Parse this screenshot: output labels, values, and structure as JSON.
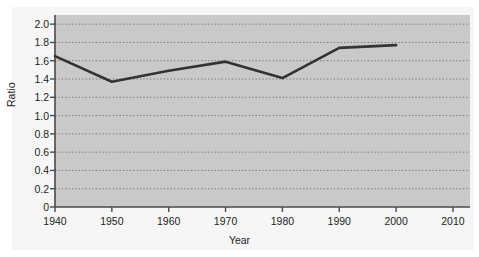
{
  "figure": {
    "background_color": "#f6f6f6",
    "plot_background_color": "#c9c9c9",
    "line_color": "#333333",
    "axis_color": "#4a4a4a",
    "grid_color": "#6e6e6e"
  },
  "chart_data": {
    "type": "line",
    "title": "",
    "xlabel": "Year",
    "ylabel": "Ratio",
    "x": [
      1940,
      1950,
      1960,
      1970,
      1980,
      1990,
      2000
    ],
    "values": [
      1.65,
      1.37,
      1.49,
      1.59,
      1.41,
      1.74,
      1.77
    ],
    "series": [
      {
        "name": "Ratio",
        "x": [
          1940,
          1950,
          1960,
          1970,
          1980,
          1990,
          2000
        ],
        "values": [
          1.65,
          1.37,
          1.49,
          1.59,
          1.41,
          1.74,
          1.77
        ]
      }
    ],
    "xlim": [
      1940,
      2013
    ],
    "ylim": [
      0,
      2.1
    ],
    "xticks": [
      1940,
      1950,
      1960,
      1970,
      1980,
      1990,
      2010
    ],
    "xtick_labels": [
      "1940",
      "1950",
      "1960",
      "1970",
      "1980",
      "1990",
      "2000",
      "2010"
    ],
    "xticks_all": [
      1940,
      1950,
      1960,
      1970,
      1980,
      1990,
      2000,
      2010
    ],
    "yticks": [
      0,
      0.2,
      0.4,
      0.6,
      0.8,
      1.0,
      1.2,
      1.4,
      1.6,
      1.8,
      2.0
    ],
    "ytick_labels": [
      "0",
      "0.2",
      "0.4",
      "0.6",
      "0.8",
      "1.0",
      "1.2",
      "1.4",
      "1.6",
      "1.8",
      "2.0"
    ],
    "grid": true,
    "grid_axis": "y",
    "grid_style": "dotted",
    "legend": null,
    "legend_position": "none",
    "annotations": []
  }
}
